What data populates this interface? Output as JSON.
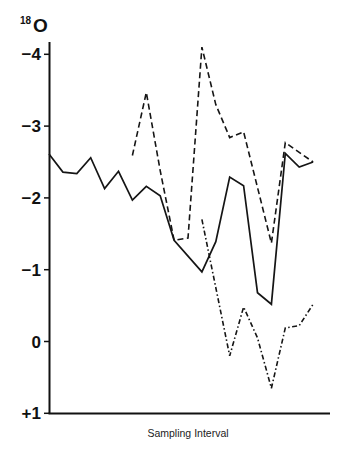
{
  "chart_data": {
    "type": "line",
    "title": "",
    "ylabel": "18O",
    "ylabel_super": "18",
    "ylabel_main": "O",
    "xlabel": "Sampling Interval",
    "yticks": [
      {
        "value": -4,
        "label": "−4"
      },
      {
        "value": -3,
        "label": "−3"
      },
      {
        "value": -2,
        "label": "−2"
      },
      {
        "value": -1,
        "label": "−1"
      },
      {
        "value": 0,
        "label": "0"
      },
      {
        "value": 1,
        "label": "+1"
      }
    ],
    "ylim": [
      1,
      -4.2
    ],
    "y_inverted": true,
    "grid": false,
    "legend": null,
    "x": [
      0,
      1,
      2,
      3,
      4,
      5,
      6,
      7,
      8,
      9,
      10,
      11,
      12,
      13,
      14,
      15,
      16,
      17,
      18,
      19
    ],
    "series": [
      {
        "name": "solid",
        "style": "solid",
        "x": [
          0,
          1,
          2,
          3,
          4,
          5,
          6,
          7,
          8,
          9,
          11,
          12,
          13,
          14,
          15,
          16,
          17,
          18,
          19
        ],
        "values": [
          -2.61,
          -2.36,
          -2.34,
          -2.56,
          -2.13,
          -2.37,
          -1.97,
          -2.16,
          -2.03,
          -1.41,
          -0.97,
          -1.39,
          -2.29,
          -2.17,
          -0.68,
          -0.52,
          -2.62,
          -2.43,
          -2.5
        ]
      },
      {
        "name": "dashed",
        "style": "dashed",
        "x": [
          6,
          7,
          8,
          9,
          10,
          11,
          12,
          13,
          14,
          16,
          17,
          19
        ],
        "values": [
          -2.59,
          -3.47,
          -2.38,
          -1.41,
          -1.44,
          -4.1,
          -3.3,
          -2.84,
          -2.92,
          -1.37,
          -2.77,
          -2.5
        ]
      },
      {
        "name": "dash-dot",
        "style": "dashdot",
        "x": [
          11,
          13,
          14,
          15,
          16,
          17,
          18,
          19
        ],
        "values": [
          -1.7,
          0.2,
          -0.48,
          -0.05,
          0.65,
          -0.19,
          -0.22,
          -0.52
        ]
      }
    ]
  }
}
